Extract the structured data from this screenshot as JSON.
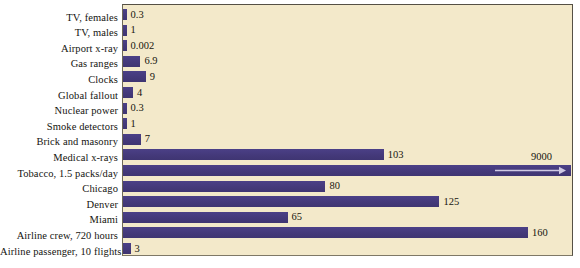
{
  "chart_data": {
    "type": "bar",
    "orientation": "horizontal",
    "title": "",
    "subtitle": "",
    "xlabel": "",
    "ylabel": "",
    "grid": false,
    "legend": null,
    "xlim": [
      0,
      177
    ],
    "axis_tick_labels": [],
    "categories": [
      "TV, females",
      "TV, males",
      "Airport x-ray",
      "Gas ranges",
      "Clocks",
      "Global fallout",
      "Nuclear power",
      "Smoke detectors",
      "Brick and masonry",
      "Medical x-rays",
      "Tobacco, 1.5 packs/day",
      "Chicago",
      "Denver",
      "Miami",
      "Airline crew, 720 hours",
      "Airline passenger, 10 flights"
    ],
    "values": [
      0.3,
      1,
      0.002,
      6.9,
      9,
      4,
      0.3,
      1,
      7,
      103,
      9000,
      80,
      125,
      65,
      160,
      3
    ],
    "value_labels": [
      "0.3",
      "1",
      "0.002",
      "6.9",
      "9",
      "4",
      "0.3",
      "1",
      "7",
      "103",
      "9000",
      "80",
      "125",
      "65",
      "160",
      "3"
    ],
    "overflow_index": 10,
    "overflow_note": "Tobacco bar runs off the right edge of the plot; its value 9000 is printed above the bar end with an arrow inside the bar.",
    "colors": {
      "bar": "#473c7e",
      "plot_background": "#f3e9ca",
      "page_background": "#ffffff",
      "border": "#555045",
      "text": "#16150f",
      "arrow": "#cfc9e4"
    }
  }
}
